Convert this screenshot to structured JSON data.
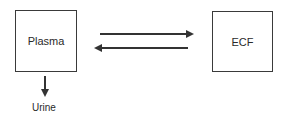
{
  "diagram": {
    "nodes": {
      "plasma": "Plasma",
      "ecf": "ECF",
      "urine": "Urine"
    },
    "edges": [
      {
        "from": "Plasma",
        "to": "ECF"
      },
      {
        "from": "ECF",
        "to": "Plasma"
      },
      {
        "from": "Plasma",
        "to": "Urine"
      }
    ]
  }
}
